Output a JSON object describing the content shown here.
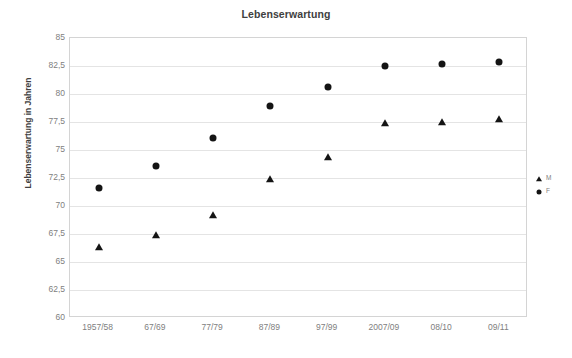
{
  "chart_data": {
    "type": "scatter",
    "title": "Lebenserwartung",
    "xlabel": "",
    "ylabel": "Lebenserwartung in Jahren",
    "categories": [
      "1957/58",
      "67/69",
      "77/79",
      "87/89",
      "97/99",
      "2007/09",
      "08/10",
      "09/11"
    ],
    "ylim": [
      60,
      85
    ],
    "yticks": [
      "60",
      "62,5",
      "65",
      "67,5",
      "70",
      "72,5",
      "75",
      "77,5",
      "80",
      "82,5",
      "85"
    ],
    "ytick_values": [
      60,
      62.5,
      65,
      67.5,
      70,
      72.5,
      75,
      77.5,
      80,
      82.5,
      85
    ],
    "ystep": 2.5,
    "grid": true,
    "legend_position": "right",
    "series": [
      {
        "name": "M",
        "marker": "triangle",
        "color": "#141414",
        "values": [
          66.3,
          67.4,
          69.2,
          72.4,
          74.4,
          77.4,
          77.5,
          77.8
        ]
      },
      {
        "name": "F",
        "marker": "circle",
        "color": "#141414",
        "values": [
          71.6,
          73.6,
          76.1,
          78.9,
          80.6,
          82.5,
          82.7,
          82.9
        ]
      }
    ]
  },
  "colors": {
    "marker": "#141414",
    "gridline": "#e4e4e4",
    "frame": "#d4d4d4",
    "tick_text": "#808080",
    "title_text": "#404040",
    "background": "#ffffff"
  }
}
